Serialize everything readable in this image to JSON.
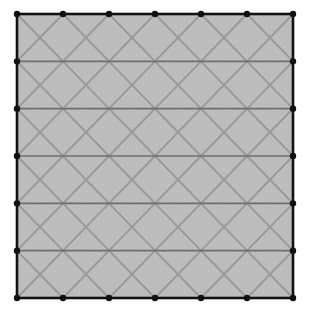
{
  "figure": {
    "name": "triangular-mesh",
    "canvas_width": 311,
    "canvas_height": 325,
    "background_color": "#ffffff"
  },
  "chart_data": {
    "type": "diagram",
    "subtype": "triangular-mesh",
    "title": "",
    "xlabel": "",
    "ylabel": "",
    "grid": false,
    "legend": null,
    "domain": {
      "x_min": 17,
      "x_max": 293,
      "y_min": 14,
      "y_max": 298,
      "width": 276,
      "height": 284,
      "shape": "square"
    },
    "mesh": {
      "columns": 6,
      "rows": 6,
      "nodes_per_side": 7,
      "cell_width": 46.0,
      "cell_height": 47.333,
      "triangles_total": 72,
      "interior_node_count": 25,
      "boundary_node_count": 24,
      "total_node_count": 49,
      "diagonal_pattern": "alternating",
      "row_patterns": [
        "V",
        "A",
        "V",
        "A",
        "V",
        "A"
      ],
      "horizontal_line_y": [
        14,
        61.33,
        108.67,
        156,
        203.33,
        250.67,
        298
      ],
      "node_x_positions": [
        17,
        63,
        109,
        155,
        201,
        247,
        293
      ],
      "node_y_positions": [
        14,
        61.33,
        108.67,
        156,
        203.33,
        250.67,
        298
      ]
    },
    "style": {
      "fill_color": "#bebebe",
      "fill_texture_color": "#b4b4b4",
      "interior_edge_color": "#9a9a9a",
      "interior_edge_width": 2.0,
      "horizontal_edge_color": "#6e6e6e",
      "horizontal_edge_width": 1.6,
      "boundary_color": "#111111",
      "boundary_width": 2.6,
      "node_color": "#111111",
      "node_radius": 3.2
    }
  }
}
